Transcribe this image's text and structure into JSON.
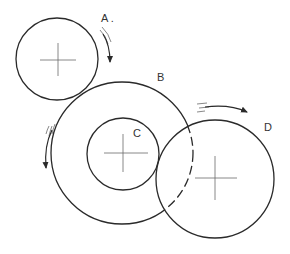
{
  "diagram": {
    "colors": {
      "stroke": "#2a2a2a",
      "crosshair": "#6a6a6a",
      "background": "#ffffff"
    },
    "labels": {
      "a": "A .",
      "b": "B",
      "c": "C",
      "d": "D"
    },
    "circles": [
      {
        "id": "A",
        "cx": 57,
        "cy": 59,
        "r": 41,
        "style": "solid"
      },
      {
        "id": "B",
        "cx": 122,
        "cy": 153,
        "r": 71,
        "style": "solid, dashed inside D"
      },
      {
        "id": "C",
        "cx": 123,
        "cy": 154,
        "r": 36,
        "style": "solid"
      },
      {
        "id": "D",
        "cx": 215,
        "cy": 179,
        "r": 59,
        "style": "solid"
      }
    ],
    "arrows": [
      {
        "near": "A",
        "direction": "clockwise (downward along right side)"
      },
      {
        "near": "B",
        "direction": "counter-clockwise (downward along left side)"
      },
      {
        "near": "D",
        "direction": "clockwise (rightward along top)"
      }
    ]
  }
}
